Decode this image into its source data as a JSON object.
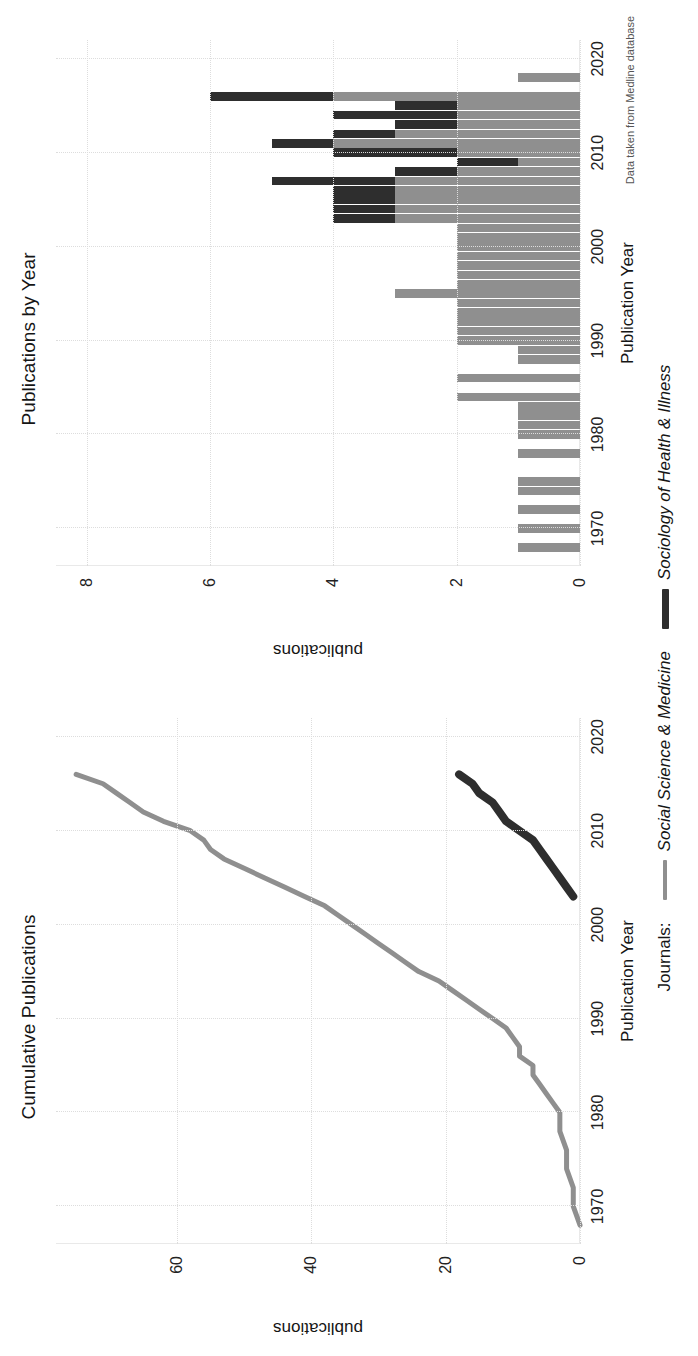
{
  "figure": {
    "caption": "Data taken from Medline database",
    "legend": {
      "title": "Journals:",
      "entries": [
        {
          "label": "Social Science & Medicine",
          "color": "#8f8f8f",
          "key": "thin-line-key"
        },
        {
          "label": "Sociology of Health & Illness",
          "color": "#2e2e2e",
          "key": "thick-line-key"
        }
      ]
    }
  },
  "panels": {
    "cumulative": {
      "title": "Cumulative Publications",
      "xlabel": "Publication Year",
      "ylabel": "publications",
      "xticks": [
        "1970",
        "1980",
        "1990",
        "2000",
        "2010",
        "2020"
      ],
      "yticks": [
        "0",
        "20",
        "40",
        "60"
      ]
    },
    "byyear": {
      "title": "Publications by Year",
      "xlabel": "Publication Year",
      "ylabel": "publications",
      "xticks": [
        "1970",
        "1980",
        "1990",
        "2000",
        "2010",
        "2020"
      ],
      "yticks": [
        "0",
        "2",
        "4",
        "6",
        "8"
      ]
    }
  },
  "chart_data": [
    {
      "type": "line",
      "title": "Cumulative Publications",
      "xlabel": "Publication Year",
      "ylabel": "publications",
      "xlim": [
        1966,
        2022
      ],
      "ylim": [
        0,
        78
      ],
      "xticks": [
        1970,
        1980,
        1990,
        2000,
        2010,
        2020
      ],
      "yticks": [
        0,
        20,
        40,
        60
      ],
      "grid": true,
      "legend_position": "bottom",
      "series": [
        {
          "name": "Social Science & Medicine",
          "color": "#8f8f8f",
          "x": [
            1968,
            1970,
            1972,
            1974,
            1975,
            1976,
            1978,
            1980,
            1981,
            1982,
            1983,
            1984,
            1985,
            1986,
            1987,
            1988,
            1989,
            1990,
            1991,
            1992,
            1993,
            1994,
            1995,
            1996,
            1997,
            1998,
            1999,
            2000,
            2001,
            2002,
            2003,
            2004,
            2005,
            2006,
            2007,
            2008,
            2009,
            2010,
            2011,
            2012,
            2013,
            2014,
            2015,
            2016
          ],
          "values": [
            0,
            1,
            1,
            2,
            2,
            2,
            3,
            3,
            4,
            5,
            6,
            7,
            7,
            9,
            9,
            10,
            11,
            13,
            15,
            17,
            19,
            21,
            24,
            26,
            28,
            30,
            32,
            34,
            36,
            38,
            41,
            44,
            47,
            50,
            53,
            55,
            56,
            58,
            62,
            65,
            67,
            69,
            71,
            75
          ]
        },
        {
          "name": "Sociology of Health & Illness",
          "color": "#2e2e2e",
          "x": [
            2003,
            2004,
            2005,
            2006,
            2007,
            2008,
            2009,
            2010,
            2011,
            2012,
            2013,
            2014,
            2015,
            2016
          ],
          "values": [
            1,
            2,
            3,
            4,
            5,
            6,
            7,
            9,
            11,
            12,
            13,
            15,
            16,
            18
          ]
        }
      ]
    },
    {
      "type": "bar",
      "stacked": true,
      "title": "Publications by Year",
      "xlabel": "Publication Year",
      "ylabel": "publications",
      "xlim": [
        1966,
        2022
      ],
      "ylim": [
        0,
        8.5
      ],
      "xticks": [
        1970,
        1980,
        1990,
        2000,
        2010,
        2020
      ],
      "yticks": [
        0,
        2,
        4,
        6,
        8
      ],
      "grid": true,
      "categories": [
        1968,
        1970,
        1972,
        1974,
        1975,
        1976,
        1978,
        1980,
        1981,
        1982,
        1983,
        1984,
        1985,
        1986,
        1987,
        1988,
        1989,
        1990,
        1991,
        1992,
        1993,
        1994,
        1995,
        1996,
        1997,
        1998,
        1999,
        2000,
        2001,
        2002,
        2003,
        2004,
        2005,
        2006,
        2007,
        2008,
        2009,
        2010,
        2011,
        2012,
        2013,
        2014,
        2015,
        2016,
        2018
      ],
      "series": [
        {
          "name": "Social Science & Medicine",
          "color": "#8f8f8f",
          "values": [
            1,
            1,
            1,
            1,
            1,
            0,
            1,
            1,
            1,
            1,
            1,
            2,
            0,
            2,
            0,
            1,
            1,
            2,
            2,
            2,
            2,
            2,
            3,
            2,
            2,
            2,
            2,
            2,
            2,
            2,
            3,
            3,
            3,
            3,
            3,
            2,
            1,
            2,
            4,
            3,
            2,
            2,
            2,
            4,
            1
          ]
        },
        {
          "name": "Sociology of Health & Illness",
          "color": "#2e2e2e",
          "values": [
            0,
            0,
            0,
            0,
            0,
            0,
            0,
            0,
            0,
            0,
            0,
            0,
            0,
            0,
            0,
            0,
            0,
            0,
            0,
            0,
            0,
            0,
            0,
            0,
            0,
            0,
            0,
            0,
            0,
            0,
            1,
            1,
            1,
            1,
            2,
            1,
            1,
            2,
            1,
            1,
            1,
            2,
            1,
            2,
            0
          ]
        }
      ]
    }
  ]
}
